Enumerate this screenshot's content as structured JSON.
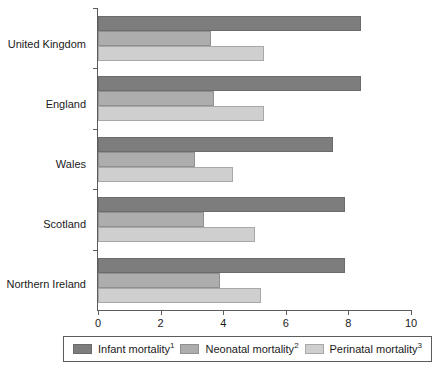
{
  "chart_data": {
    "type": "bar",
    "orientation": "horizontal",
    "title": "",
    "xlabel": "",
    "ylabel": "",
    "categories": [
      "United Kingdom",
      "England",
      "Wales",
      "Scotland",
      "Northern Ireland"
    ],
    "series": [
      {
        "name": "Infant mortality",
        "footnote": "1",
        "color": "#7d7d7d",
        "values": [
          8.4,
          8.4,
          7.5,
          7.9,
          7.9
        ]
      },
      {
        "name": "Neonatal mortality",
        "footnote": "2",
        "color": "#adadad",
        "values": [
          3.6,
          3.7,
          3.1,
          3.4,
          3.9
        ]
      },
      {
        "name": "Perinatal mortality",
        "footnote": "3",
        "color": "#cfcfcf",
        "values": [
          5.3,
          5.3,
          4.3,
          5.0,
          5.2
        ]
      }
    ],
    "xlim": [
      0,
      10
    ],
    "xticks": [
      0,
      2,
      4,
      6,
      8,
      10
    ],
    "xtick_labels": [
      "0",
      "2",
      "4",
      "6",
      "8",
      "10"
    ],
    "grid": false,
    "legend_position": "bottom"
  },
  "legend": {
    "items": [
      {
        "label": "Infant mortality",
        "sup": "1",
        "swatch": "dark-gray-swatch-icon"
      },
      {
        "label": "Neonatal mortality",
        "sup": "2",
        "swatch": "medium-gray-swatch-icon"
      },
      {
        "label": "Perinatal mortality",
        "sup": "3",
        "swatch": "light-gray-swatch-icon"
      }
    ]
  },
  "axis": {
    "x_tick_labels": [
      "0",
      "2",
      "4",
      "6",
      "8",
      "10"
    ]
  },
  "categories": [
    "United Kingdom",
    "England",
    "Wales",
    "Scotland",
    "Northern Ireland"
  ]
}
